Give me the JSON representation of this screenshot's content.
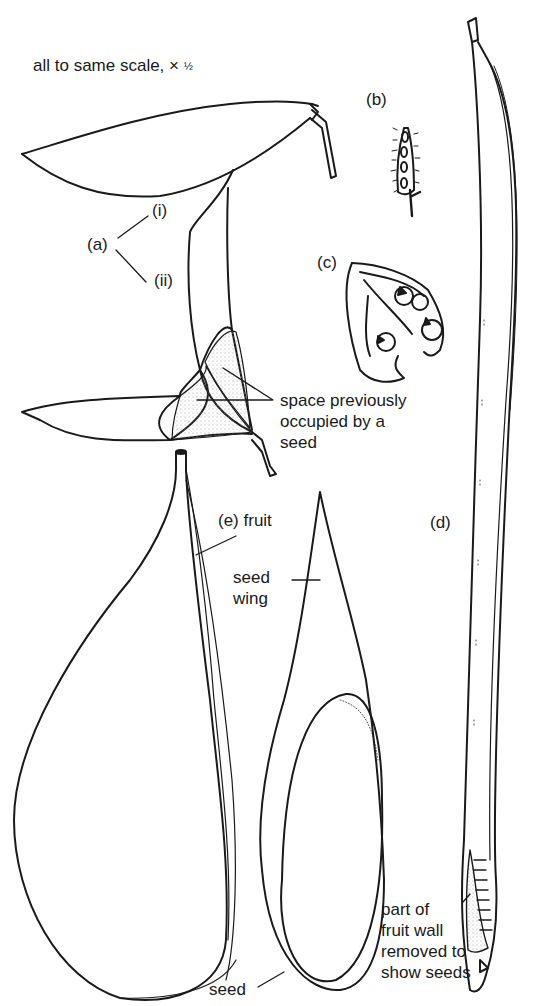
{
  "figure": {
    "scale_note": "all to same scale,",
    "scale_symbol": "×",
    "scale_fraction": "½",
    "labels": {
      "a": "(a)",
      "a_i": "(i)",
      "a_ii": "(ii)",
      "b": "(b)",
      "c": "(c)",
      "d": "(d)",
      "e_fruit": "(e)  fruit",
      "space_note": "space previously\noccupied by a\nseed",
      "seed_wing": "seed\nwing",
      "seed": "seed",
      "fruit_wall_note": "part of\nfruit wall\nremoved to\nshow seeds"
    },
    "parts": [
      {
        "id": "a",
        "description": "two-winged fruit, views (i) and (ii)"
      },
      {
        "id": "b",
        "description": "small hairy pod with four seeds"
      },
      {
        "id": "c",
        "description": "dehisced twisted pod with seeds"
      },
      {
        "id": "d",
        "description": "long slender pod"
      },
      {
        "id": "e",
        "description": "winged fruit and seed"
      }
    ],
    "colors": {
      "ink": "#1a1a1a",
      "background": "#ffffff",
      "stipple": "#bdbdbd"
    }
  }
}
